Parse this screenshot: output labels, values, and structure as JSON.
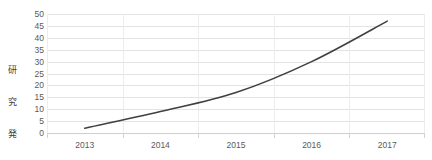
{
  "chart_data": {
    "type": "line",
    "title": "",
    "xlabel": "",
    "ylabel": "研究発表数",
    "categories": [
      "2013",
      "2014",
      "2015",
      "2016",
      "2017"
    ],
    "values": [
      2,
      9,
      17,
      30,
      47
    ],
    "series": [
      {
        "name": "研究発表数",
        "values": [
          2,
          9,
          17,
          30,
          47
        ]
      }
    ],
    "ylim": [
      0,
      50
    ],
    "ytick_step": 5,
    "ytick_labels": [
      "0",
      "5",
      "10",
      "15",
      "20",
      "25",
      "30",
      "35",
      "40",
      "45",
      "50"
    ],
    "grid": {
      "horizontal": true,
      "vertical": true
    },
    "legend": {
      "visible": false,
      "position": "none"
    },
    "markers": false,
    "smooth": true,
    "colors": {
      "line": "#404040",
      "gridline": "#e3e3e3",
      "vertical_gridline": "#ededed",
      "axis": "#cfcfcf",
      "tick_text": "#5a5a5a",
      "axis_title_text": "#3f3f3f",
      "background": "#ffffff"
    }
  },
  "axis_title_chars": [
    "研",
    "究",
    "発",
    "表",
    "数"
  ]
}
